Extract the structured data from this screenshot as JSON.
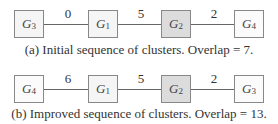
{
  "diagrams": [
    {
      "nodes": [
        {
          "name": "G",
          "sub": "3"
        },
        {
          "name": "G",
          "sub": "1"
        },
        {
          "name": "G",
          "sub": "2"
        },
        {
          "name": "G",
          "sub": "4"
        }
      ],
      "weights": [
        "0",
        "5",
        "2"
      ],
      "caption": "(a) Initial sequence of clusters. Overlap = 7."
    },
    {
      "nodes": [
        {
          "name": "G",
          "sub": "4"
        },
        {
          "name": "G",
          "sub": "1"
        },
        {
          "name": "G",
          "sub": "2"
        },
        {
          "name": "G",
          "sub": "3"
        }
      ],
      "weights": [
        "6",
        "5",
        "2"
      ],
      "caption": "(b) Improved sequence of clusters. Overlap = 13."
    }
  ]
}
